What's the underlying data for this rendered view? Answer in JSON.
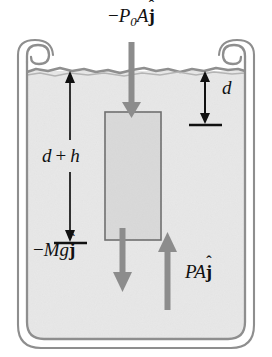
{
  "figure": {
    "background_color": "#ffffff"
  },
  "container": {
    "name": "fluid-container",
    "wall_color": "#8a8a8a",
    "rim_style": "curled-lip",
    "bottom_style": "rounded"
  },
  "fluid": {
    "name": "fluid",
    "fill_color": "#e6e6e6",
    "surface_style": "wavy",
    "surface_color": "#9a9a9a"
  },
  "block": {
    "name": "submerged-block",
    "fill_color": "#d8d8d8",
    "border_color": "#707070"
  },
  "labels": {
    "top_force": {
      "full": "-P0A j-hat",
      "minus": "−",
      "P": "P",
      "subscript": "0",
      "A": "A",
      "jhat": "j",
      "hat": "ˆ"
    },
    "depth_d": {
      "text": "d"
    },
    "depth_dh": {
      "full": "d + h",
      "d": "d",
      "plus": "+",
      "h": "h"
    },
    "weight": {
      "full": "-Mg j-hat",
      "minus": "−",
      "M": "M",
      "g": "g",
      "jhat": "j",
      "hat": "ˆ"
    },
    "buoyant_force": {
      "full": "PA j-hat",
      "P": "P",
      "A": "A",
      "jhat": "j",
      "hat": "ˆ"
    }
  },
  "arrows": {
    "pressure_down": {
      "name": "pressure-force-arrow",
      "direction": "down",
      "color": "#8c8c8c",
      "label": "-P0A j-hat"
    },
    "weight_down": {
      "name": "weight-force-arrow",
      "direction": "down",
      "color": "#8c8c8c",
      "label": "-Mg j-hat"
    },
    "buoyant_up": {
      "name": "buoyant-force-arrow",
      "direction": "up",
      "color": "#8c8c8c",
      "label": "PA j-hat"
    },
    "dimension_d": {
      "name": "depth-d-dimension-arrow",
      "direction": "double",
      "color": "#111111",
      "label": "d"
    },
    "dimension_dh": {
      "name": "depth-d-plus-h-dimension-arrow",
      "direction": "double",
      "color": "#111111",
      "label": "d + h"
    }
  }
}
